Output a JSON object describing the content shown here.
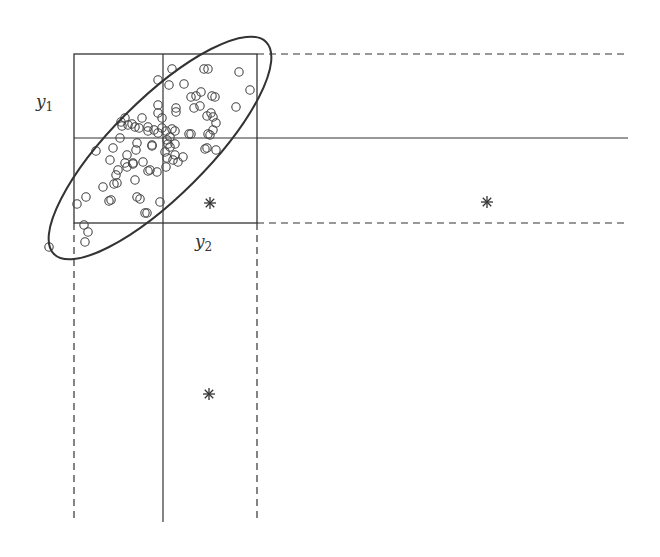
{
  "diagram": {
    "type": "bivariate-outlier-illustration",
    "stroke_color": "#333333",
    "labels": {
      "y1": {
        "base": "y",
        "sub": "1",
        "x": 36,
        "y": 107
      },
      "y2": {
        "base": "y",
        "sub": "2",
        "x": 195,
        "y": 247
      }
    },
    "box": {
      "x1": 74,
      "y1": 54,
      "x2": 257,
      "y2": 223
    },
    "lines": {
      "vertical_solid_x": 163,
      "horizontal_solid_y": 138,
      "extend_right_to": 628,
      "extend_down_to": 522
    },
    "ellipse": {
      "cx": 160,
      "cy": 148,
      "rx": 150,
      "ry": 48,
      "rotation": -45
    },
    "outliers": [
      {
        "x": 210,
        "y": 203,
        "symbol": "*"
      },
      {
        "x": 487,
        "y": 202,
        "symbol": "*"
      },
      {
        "x": 209,
        "y": 394,
        "symbol": "*"
      }
    ],
    "points": [
      [
        172,
        69
      ],
      [
        204,
        69
      ],
      [
        208,
        69
      ],
      [
        239,
        72
      ],
      [
        158,
        80
      ],
      [
        169,
        85
      ],
      [
        184,
        84
      ],
      [
        250,
        90
      ],
      [
        191,
        97
      ],
      [
        196,
        96
      ],
      [
        201,
        92
      ],
      [
        212,
        96
      ],
      [
        215,
        97
      ],
      [
        158,
        105
      ],
      [
        176,
        108
      ],
      [
        176,
        112
      ],
      [
        194,
        108
      ],
      [
        200,
        106
      ],
      [
        236,
        107
      ],
      [
        207,
        116
      ],
      [
        211,
        113
      ],
      [
        158,
        113
      ],
      [
        162,
        118
      ],
      [
        125,
        118
      ],
      [
        122,
        126
      ],
      [
        132,
        124
      ],
      [
        142,
        118
      ],
      [
        135,
        127
      ],
      [
        148,
        127
      ],
      [
        154,
        130
      ],
      [
        162,
        128
      ],
      [
        213,
        117
      ],
      [
        216,
        123
      ],
      [
        121,
        122
      ],
      [
        128,
        125
      ],
      [
        139,
        128
      ],
      [
        148,
        131
      ],
      [
        158,
        133
      ],
      [
        166,
        131
      ],
      [
        172,
        129
      ],
      [
        175,
        131
      ],
      [
        189,
        134
      ],
      [
        191,
        134
      ],
      [
        210,
        135
      ],
      [
        213,
        130
      ],
      [
        170,
        137
      ],
      [
        167,
        140
      ],
      [
        168,
        144
      ],
      [
        170,
        147
      ],
      [
        175,
        144
      ],
      [
        208,
        134
      ],
      [
        207,
        148
      ],
      [
        96,
        151
      ],
      [
        113,
        148
      ],
      [
        120,
        138
      ],
      [
        137,
        143
      ],
      [
        152,
        145
      ],
      [
        110,
        160
      ],
      [
        127,
        155
      ],
      [
        136,
        150
      ],
      [
        152,
        146
      ],
      [
        165,
        152
      ],
      [
        167,
        158
      ],
      [
        173,
        160
      ],
      [
        175,
        155
      ],
      [
        133,
        163
      ],
      [
        125,
        163
      ],
      [
        118,
        170
      ],
      [
        127,
        167
      ],
      [
        133,
        164
      ],
      [
        143,
        162
      ],
      [
        157,
        172
      ],
      [
        166,
        167
      ],
      [
        178,
        162
      ],
      [
        183,
        157
      ],
      [
        205,
        149
      ],
      [
        216,
        150
      ],
      [
        116,
        175
      ],
      [
        114,
        184
      ],
      [
        117,
        183
      ],
      [
        103,
        187
      ],
      [
        135,
        180
      ],
      [
        148,
        171
      ],
      [
        150,
        170
      ],
      [
        86,
        197
      ],
      [
        77,
        204
      ],
      [
        109,
        201
      ],
      [
        111,
        200
      ],
      [
        137,
        197
      ],
      [
        140,
        199
      ],
      [
        160,
        202
      ],
      [
        145,
        213
      ],
      [
        147,
        213
      ],
      [
        84,
        225
      ],
      [
        88,
        232
      ],
      [
        85,
        242
      ],
      [
        49,
        247
      ]
    ]
  }
}
